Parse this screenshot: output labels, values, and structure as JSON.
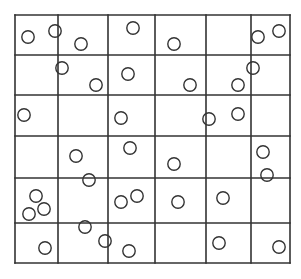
{
  "diagram": {
    "type": "grid-with-points",
    "grid": {
      "rows": 6,
      "cols": 6,
      "x_lines": [
        15,
        58,
        108,
        155,
        206,
        251,
        290
      ],
      "y_lines": [
        15,
        55,
        95,
        136,
        178,
        223,
        263
      ],
      "line_color": "#333333",
      "line_width": 1.6
    },
    "circle_style": {
      "radius": 6.2,
      "stroke": "#333333",
      "stroke_width": 1.4,
      "fill": "none"
    },
    "circles": [
      {
        "x": 28,
        "y": 37
      },
      {
        "x": 55,
        "y": 31
      },
      {
        "x": 81,
        "y": 44
      },
      {
        "x": 133,
        "y": 28
      },
      {
        "x": 174,
        "y": 44
      },
      {
        "x": 258,
        "y": 37
      },
      {
        "x": 279,
        "y": 31
      },
      {
        "x": 62,
        "y": 68
      },
      {
        "x": 96,
        "y": 85
      },
      {
        "x": 128,
        "y": 74
      },
      {
        "x": 190,
        "y": 85
      },
      {
        "x": 253,
        "y": 68
      },
      {
        "x": 238,
        "y": 85
      },
      {
        "x": 24,
        "y": 115
      },
      {
        "x": 121,
        "y": 118
      },
      {
        "x": 209,
        "y": 119
      },
      {
        "x": 238,
        "y": 114
      },
      {
        "x": 76,
        "y": 156
      },
      {
        "x": 130,
        "y": 148
      },
      {
        "x": 174,
        "y": 164
      },
      {
        "x": 263,
        "y": 152
      },
      {
        "x": 89,
        "y": 180
      },
      {
        "x": 267,
        "y": 175
      },
      {
        "x": 36,
        "y": 196
      },
      {
        "x": 44,
        "y": 209
      },
      {
        "x": 29,
        "y": 214
      },
      {
        "x": 121,
        "y": 202
      },
      {
        "x": 137,
        "y": 196
      },
      {
        "x": 178,
        "y": 202
      },
      {
        "x": 223,
        "y": 198
      },
      {
        "x": 45,
        "y": 248
      },
      {
        "x": 85,
        "y": 227
      },
      {
        "x": 105,
        "y": 241
      },
      {
        "x": 129,
        "y": 251
      },
      {
        "x": 219,
        "y": 243
      },
      {
        "x": 279,
        "y": 247
      }
    ]
  }
}
